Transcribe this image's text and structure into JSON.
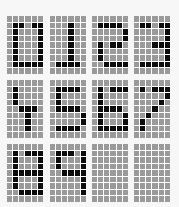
{
  "grid": {
    "columns": 4,
    "rows": 3,
    "cell_cols": 6,
    "cell_rows": 9,
    "colors": {
      "background": "#f7f7f7",
      "pixel_off": "#9a9a9a",
      "pixel_on": "#0c0c0c",
      "gridline": "#ffffff"
    }
  },
  "cells": [
    {
      "label": "0",
      "x": 7,
      "y": 16,
      "on": [
        [
          1,
          1
        ],
        [
          1,
          2
        ],
        [
          1,
          4
        ],
        [
          1,
          5
        ],
        [
          2,
          1
        ],
        [
          2,
          5
        ],
        [
          3,
          1
        ],
        [
          3,
          5
        ],
        [
          4,
          1
        ],
        [
          4,
          5
        ],
        [
          5,
          1
        ],
        [
          5,
          5
        ],
        [
          6,
          1
        ],
        [
          6,
          5
        ],
        [
          7,
          1
        ],
        [
          7,
          2
        ],
        [
          7,
          3
        ],
        [
          7,
          4
        ],
        [
          7,
          5
        ]
      ]
    },
    {
      "label": "1",
      "x": 50,
      "y": 16,
      "on": [
        [
          1,
          3
        ],
        [
          2,
          3
        ],
        [
          3,
          3
        ],
        [
          4,
          3
        ],
        [
          5,
          3
        ],
        [
          6,
          3
        ],
        [
          7,
          1
        ],
        [
          7,
          2
        ],
        [
          7,
          3
        ],
        [
          7,
          4
        ]
      ]
    },
    {
      "label": "2",
      "x": 92,
      "y": 16,
      "on": [
        [
          1,
          1
        ],
        [
          1,
          2
        ],
        [
          1,
          3
        ],
        [
          1,
          4
        ],
        [
          2,
          5
        ],
        [
          3,
          5
        ],
        [
          4,
          1
        ],
        [
          4,
          3
        ],
        [
          4,
          4
        ],
        [
          5,
          1
        ],
        [
          6,
          1
        ],
        [
          7,
          2
        ],
        [
          7,
          3
        ],
        [
          7,
          4
        ],
        [
          7,
          5
        ]
      ]
    },
    {
      "label": "3",
      "x": 134,
      "y": 16,
      "on": [
        [
          1,
          1
        ],
        [
          1,
          2
        ],
        [
          1,
          4
        ],
        [
          1,
          5
        ],
        [
          2,
          5
        ],
        [
          3,
          5
        ],
        [
          4,
          3
        ],
        [
          4,
          4
        ],
        [
          4,
          5
        ],
        [
          5,
          5
        ],
        [
          6,
          5
        ],
        [
          7,
          1
        ],
        [
          7,
          2
        ],
        [
          7,
          3
        ],
        [
          7,
          4
        ],
        [
          7,
          5
        ]
      ]
    },
    {
      "label": "4",
      "x": 7,
      "y": 80,
      "on": [
        [
          1,
          1
        ],
        [
          2,
          1
        ],
        [
          3,
          1
        ],
        [
          4,
          2
        ],
        [
          4,
          3
        ],
        [
          4,
          4
        ],
        [
          5,
          3
        ],
        [
          6,
          3
        ],
        [
          7,
          3
        ]
      ]
    },
    {
      "label": "5",
      "x": 50,
      "y": 80,
      "on": [
        [
          1,
          1
        ],
        [
          1,
          2
        ],
        [
          1,
          3
        ],
        [
          1,
          4
        ],
        [
          2,
          1
        ],
        [
          3,
          1
        ],
        [
          4,
          1
        ],
        [
          4,
          2
        ],
        [
          4,
          3
        ],
        [
          4,
          4
        ],
        [
          5,
          5
        ],
        [
          6,
          5
        ],
        [
          7,
          1
        ],
        [
          7,
          2
        ],
        [
          7,
          3
        ],
        [
          7,
          4
        ]
      ]
    },
    {
      "label": "6",
      "x": 92,
      "y": 80,
      "on": [
        [
          1,
          1
        ],
        [
          1,
          3
        ],
        [
          1,
          4
        ],
        [
          1,
          5
        ],
        [
          2,
          1
        ],
        [
          3,
          1
        ],
        [
          4,
          1
        ],
        [
          4,
          2
        ],
        [
          4,
          3
        ],
        [
          4,
          4
        ],
        [
          5,
          1
        ],
        [
          5,
          5
        ],
        [
          6,
          1
        ],
        [
          6,
          5
        ],
        [
          7,
          1
        ],
        [
          7,
          2
        ],
        [
          7,
          3
        ],
        [
          7,
          4
        ],
        [
          7,
          5
        ]
      ]
    },
    {
      "label": "7",
      "x": 134,
      "y": 80,
      "on": [
        [
          1,
          1
        ],
        [
          1,
          3
        ],
        [
          1,
          4
        ],
        [
          1,
          5
        ],
        [
          2,
          5
        ],
        [
          3,
          4
        ],
        [
          4,
          3
        ],
        [
          5,
          2
        ],
        [
          6,
          1
        ],
        [
          7,
          1
        ]
      ]
    },
    {
      "label": "8",
      "x": 7,
      "y": 144,
      "on": [
        [
          1,
          1
        ],
        [
          1,
          3
        ],
        [
          1,
          4
        ],
        [
          1,
          5
        ],
        [
          2,
          1
        ],
        [
          2,
          5
        ],
        [
          3,
          1
        ],
        [
          3,
          5
        ],
        [
          4,
          1
        ],
        [
          4,
          2
        ],
        [
          4,
          3
        ],
        [
          4,
          4
        ],
        [
          4,
          5
        ],
        [
          5,
          1
        ],
        [
          5,
          5
        ],
        [
          6,
          1
        ],
        [
          6,
          5
        ],
        [
          7,
          2
        ],
        [
          7,
          3
        ],
        [
          7,
          4
        ],
        [
          7,
          5
        ]
      ]
    },
    {
      "label": "9",
      "x": 50,
      "y": 144,
      "on": [
        [
          1,
          1
        ],
        [
          1,
          2
        ],
        [
          1,
          3
        ],
        [
          1,
          5
        ],
        [
          2,
          1
        ],
        [
          2,
          5
        ],
        [
          3,
          1
        ],
        [
          3,
          5
        ],
        [
          4,
          2
        ],
        [
          4,
          3
        ],
        [
          4,
          4
        ],
        [
          4,
          5
        ],
        [
          5,
          5
        ],
        [
          6,
          5
        ],
        [
          7,
          5
        ]
      ]
    },
    {
      "label": "",
      "x": 92,
      "y": 144,
      "on": []
    },
    {
      "label": "",
      "x": 134,
      "y": 144,
      "on": []
    }
  ]
}
